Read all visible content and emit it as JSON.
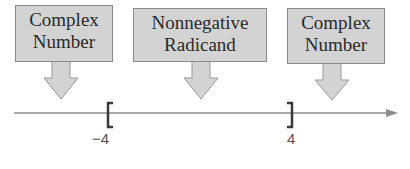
{
  "diagram": {
    "callouts": [
      {
        "id": "left",
        "line1": "Complex",
        "line2": "Number"
      },
      {
        "id": "middle",
        "line1": "Nonnegative",
        "line2": "Radicand"
      },
      {
        "id": "right",
        "line1": "Complex",
        "line2": "Number"
      }
    ],
    "number_line": {
      "left_endpoint": {
        "label": "−4",
        "bracket": "["
      },
      "right_endpoint": {
        "label": "4",
        "bracket": "]"
      }
    },
    "colors": {
      "box_fill": "#d3d3d3",
      "box_border": "#8a8a8a",
      "axis": "#8c8c8c",
      "bracket": "#3a3a3a"
    }
  }
}
